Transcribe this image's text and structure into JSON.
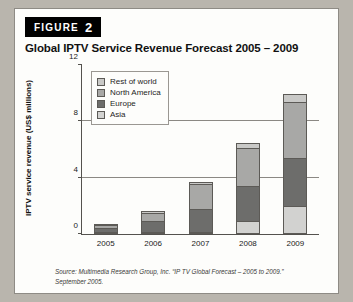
{
  "figure": {
    "word": "FIGURE",
    "number": "2"
  },
  "title": "Global IPTV Service Revenue Forecast 2005 – 2009",
  "source": {
    "line1": "Source: Multimedia Research Group, Inc. “IP TV Global Forecast – 2005 to 2009.”",
    "line2": "September 2005."
  },
  "colors": {
    "rest_of_world": "#c9c9c7",
    "north_america": "#a8a8a6",
    "europe": "#6d6d6b",
    "asia": "#d2d2d0",
    "badge": "#000000",
    "axis": "#54524e",
    "grid": "#8b8883",
    "card": "#fdfdfb",
    "page": "#b9b5ad"
  },
  "chart_data": {
    "type": "bar",
    "stacked": true,
    "title": "Global IPTV Service Revenue Forecast 2005 – 2009",
    "xlabel": "",
    "ylabel": "IPTV service revenue (US$ millions)",
    "ylim": [
      0,
      12
    ],
    "yticks": [
      0,
      4,
      8,
      12
    ],
    "gridlines": [
      4,
      8
    ],
    "grid": true,
    "legend_position": "top-left-inside",
    "categories": [
      "2005",
      "2006",
      "2007",
      "2008",
      "2009"
    ],
    "stack_order_bottom_to_top": [
      "Asia",
      "Europe",
      "North America",
      "Rest of world"
    ],
    "series": [
      {
        "name": "Asia",
        "values": [
          0.05,
          0.1,
          0.15,
          0.9,
          2.0
        ]
      },
      {
        "name": "Europe",
        "values": [
          0.3,
          0.75,
          1.65,
          2.5,
          3.4
        ]
      },
      {
        "name": "North America",
        "values": [
          0.2,
          0.6,
          1.7,
          2.7,
          3.9
        ]
      },
      {
        "name": "Rest of world",
        "values": [
          0.05,
          0.1,
          0.15,
          0.3,
          0.6
        ]
      }
    ],
    "totals": [
      0.6,
      1.55,
      3.65,
      6.4,
      9.9
    ]
  },
  "legend": [
    {
      "label": "Rest of world",
      "color": "#c9c9c7"
    },
    {
      "label": "North America",
      "color": "#a8a8a6"
    },
    {
      "label": "Europe",
      "color": "#6d6d6b"
    },
    {
      "label": "Asia",
      "color": "#d2d2d0"
    }
  ]
}
